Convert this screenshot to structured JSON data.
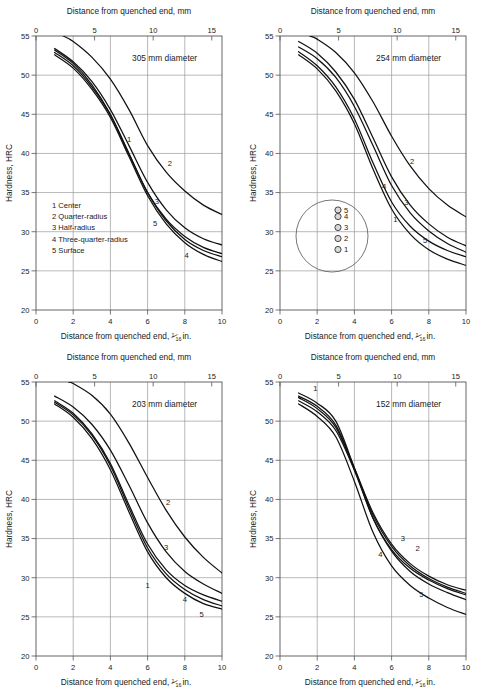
{
  "figure": {
    "axis_titles": {
      "top": "Distance from quenched end, mm",
      "bottom_prefix": "Distance from quenched end, ",
      "bottom_frac_num": "1",
      "bottom_frac_den": "16",
      "bottom_suffix": " in.",
      "y": "Hardness, HRC"
    },
    "legend": {
      "items": [
        "1 Center",
        "2 Quarter-radius",
        "3 Half-radius",
        "4 Three-quarter-radius",
        "5 Surface"
      ]
    },
    "section_diagram": {
      "point_labels": [
        "5",
        "4",
        "3",
        "2",
        "1"
      ]
    },
    "colors": {
      "curve": "#111111",
      "grid": "#9a9a9a",
      "frame": "#555555",
      "text": "#222222"
    }
  },
  "chart_data": [
    {
      "type": "line",
      "title": "305 mm diameter",
      "panel": "top-left",
      "xlabel": "Distance from quenched end, 1/16 in.",
      "ylabel": "Hardness, HRC",
      "xlabel_top": "Distance from quenched end, mm",
      "xlim": [
        0,
        10
      ],
      "ylim": [
        20,
        55
      ],
      "xlim_top_mm": [
        0,
        15.875
      ],
      "xticks": [
        0,
        2,
        4,
        6,
        8,
        10
      ],
      "yticks": [
        20,
        25,
        30,
        35,
        40,
        45,
        50,
        55
      ],
      "xticks_top": [
        0,
        5,
        10,
        15
      ],
      "grid": true,
      "legend_position": "inside-lower-left",
      "x": [
        1,
        2,
        3,
        4,
        5,
        6,
        7,
        8,
        9,
        10
      ],
      "series": [
        {
          "name": "1",
          "label": "Center",
          "values": [
            53.2,
            51.5,
            48.8,
            45.0,
            40.0,
            35.0,
            31.6,
            29.4,
            28.0,
            27.2
          ],
          "label_at": [
            5.0,
            41.5
          ]
        },
        {
          "name": "2",
          "label": "Quarter-radius",
          "values": [
            55.6,
            54.3,
            52.3,
            49.5,
            45.6,
            41.0,
            37.6,
            35.2,
            33.4,
            32.2
          ],
          "label_at": [
            7.2,
            38.4
          ]
        },
        {
          "name": "3",
          "label": "Half-radius",
          "values": [
            53.4,
            51.7,
            49.2,
            45.6,
            41.0,
            36.3,
            32.8,
            30.5,
            29.1,
            28.3
          ],
          "label_at": [
            6.5,
            33.6
          ]
        },
        {
          "name": "4",
          "label": "Three-quarter-radius",
          "values": [
            52.6,
            50.9,
            48.2,
            44.6,
            39.6,
            34.6,
            31.0,
            28.6,
            27.1,
            26.2
          ],
          "label_at": [
            8.1,
            26.6
          ]
        },
        {
          "name": "5",
          "label": "Surface",
          "values": [
            52.9,
            51.2,
            48.5,
            44.9,
            39.9,
            35.0,
            31.4,
            29.0,
            27.6,
            26.8
          ],
          "label_at": [
            6.4,
            30.7
          ]
        }
      ]
    },
    {
      "type": "line",
      "title": "254 mm diameter",
      "panel": "top-right",
      "xlabel": "Distance from quenched end, 1/16 in.",
      "ylabel": "Hardness, HRC",
      "xlabel_top": "Distance from quenched end, mm",
      "xlim": [
        0,
        10
      ],
      "ylim": [
        20,
        55
      ],
      "xlim_top_mm": [
        0,
        15.875
      ],
      "xticks": [
        0,
        2,
        4,
        6,
        8,
        10
      ],
      "yticks": [
        20,
        25,
        30,
        35,
        40,
        45,
        50,
        55
      ],
      "xticks_top": [
        0,
        5,
        10,
        15
      ],
      "grid": true,
      "legend_position": "section-circle-inside",
      "x": [
        1,
        2,
        3,
        4,
        5,
        6,
        7,
        8,
        9,
        10
      ],
      "series": [
        {
          "name": "1",
          "label": "Center",
          "values": [
            53.0,
            51.2,
            48.5,
            44.4,
            38.8,
            33.8,
            30.7,
            28.8,
            27.6,
            26.8
          ],
          "label_at": [
            6.2,
            31.2
          ]
        },
        {
          "name": "2",
          "label": "Quarter-radius",
          "values": [
            55.6,
            54.6,
            52.9,
            50.3,
            46.6,
            42.2,
            38.4,
            35.5,
            33.4,
            31.9
          ],
          "label_at": [
            7.1,
            38.6
          ]
        },
        {
          "name": "3",
          "label": "Half-radius",
          "values": [
            54.3,
            52.8,
            50.4,
            46.9,
            42.0,
            37.0,
            33.4,
            31.0,
            29.3,
            28.2
          ],
          "label_at": [
            6.8,
            33.4
          ]
        },
        {
          "name": "4",
          "label": "Three-quarter-radius",
          "values": [
            53.6,
            52.1,
            49.7,
            46.0,
            41.0,
            35.9,
            32.4,
            30.1,
            28.5,
            27.4
          ],
          "label_at": [
            5.6,
            35.4
          ]
        },
        {
          "name": "5",
          "label": "Surface",
          "values": [
            52.6,
            50.8,
            48.0,
            43.8,
            38.0,
            32.9,
            29.7,
            27.7,
            26.5,
            25.7
          ],
          "label_at": [
            7.8,
            28.6
          ]
        }
      ]
    },
    {
      "type": "line",
      "title": "203 mm diameter",
      "panel": "bottom-left",
      "xlabel": "Distance from quenched end, 1/16 in.",
      "ylabel": "Hardness, HRC",
      "xlabel_top": "Distance from quenched end, mm",
      "xlim": [
        0,
        10
      ],
      "ylim": [
        20,
        55
      ],
      "xlim_top_mm": [
        0,
        15.875
      ],
      "xticks": [
        0,
        2,
        4,
        6,
        8,
        10
      ],
      "yticks": [
        20,
        25,
        30,
        35,
        40,
        45,
        50,
        55
      ],
      "xticks_top": [
        0,
        5,
        10,
        15
      ],
      "grid": true,
      "legend_position": "none",
      "x": [
        1,
        2,
        3,
        4,
        5,
        6,
        7,
        8,
        9,
        10
      ],
      "series": [
        {
          "name": "1",
          "label": "Center",
          "values": [
            52.6,
            51.0,
            48.4,
            44.6,
            39.3,
            34.3,
            31.0,
            29.0,
            27.8,
            27.0
          ],
          "label_at": [
            6.0,
            28.7
          ]
        },
        {
          "name": "2",
          "label": "Quarter-radius",
          "values": [
            55.6,
            54.8,
            53.3,
            50.9,
            47.2,
            42.8,
            38.6,
            35.2,
            32.6,
            30.6
          ],
          "label_at": [
            7.1,
            39.3
          ]
        },
        {
          "name": "3",
          "label": "Half-radius",
          "values": [
            53.2,
            51.8,
            49.6,
            46.3,
            41.8,
            37.0,
            33.3,
            30.8,
            29.2,
            28.0
          ],
          "label_at": [
            7.0,
            33.5
          ]
        },
        {
          "name": "4",
          "label": "Three-quarter-radius",
          "values": [
            52.4,
            50.8,
            48.2,
            44.3,
            38.9,
            33.8,
            30.5,
            28.5,
            27.2,
            26.4
          ],
          "label_at": [
            8.0,
            26.9
          ]
        },
        {
          "name": "5",
          "label": "Surface",
          "values": [
            52.2,
            50.5,
            47.8,
            43.8,
            38.4,
            33.3,
            30.0,
            28.0,
            26.7,
            26.0
          ],
          "label_at": [
            8.9,
            25.0
          ]
        }
      ]
    },
    {
      "type": "line",
      "title": "152 mm diameter",
      "panel": "bottom-right",
      "xlabel": "Distance from quenched end, 1/16 in.",
      "ylabel": "Hardness, HRC",
      "xlabel_top": "Distance from quenched end, mm",
      "xlim": [
        0,
        10
      ],
      "ylim": [
        20,
        55
      ],
      "xlim_top_mm": [
        0,
        15.875
      ],
      "xticks": [
        0,
        2,
        4,
        6,
        8,
        10
      ],
      "yticks": [
        20,
        25,
        30,
        35,
        40,
        45,
        50,
        55
      ],
      "xticks_top": [
        0,
        5,
        10,
        15
      ],
      "grid": true,
      "legend_position": "none",
      "x": [
        1,
        2,
        3,
        4,
        5,
        6,
        7,
        8,
        9,
        10
      ],
      "series": [
        {
          "name": "1",
          "label": "Center",
          "values": [
            53.6,
            52.3,
            50.0,
            44.0,
            37.6,
            33.6,
            31.2,
            29.7,
            28.6,
            27.8
          ],
          "label_at": [
            1.9,
            53.8
          ]
        },
        {
          "name": "2",
          "label": "Quarter-radius",
          "values": [
            53.2,
            51.9,
            49.5,
            44.0,
            38.3,
            34.3,
            31.8,
            30.2,
            29.1,
            28.4
          ],
          "label_at": [
            7.4,
            33.4
          ]
        },
        {
          "name": "3",
          "label": "Half-radius",
          "values": [
            53.0,
            51.6,
            49.2,
            43.9,
            38.0,
            34.0,
            31.5,
            29.9,
            28.8,
            28.0
          ],
          "label_at": [
            6.6,
            34.7
          ]
        },
        {
          "name": "4",
          "label": "Three-quarter-radius",
          "values": [
            52.6,
            51.2,
            48.8,
            43.7,
            37.6,
            33.4,
            30.8,
            29.2,
            28.1,
            27.2
          ],
          "label_at": [
            5.4,
            32.6
          ]
        },
        {
          "name": "5",
          "label": "Surface",
          "values": [
            52.2,
            50.6,
            48.0,
            42.3,
            35.8,
            31.5,
            29.0,
            27.4,
            26.2,
            25.3
          ],
          "label_at": [
            7.6,
            27.6
          ]
        }
      ]
    }
  ]
}
